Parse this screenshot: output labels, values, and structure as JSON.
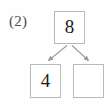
{
  "exercise": {
    "number_label": "(2)"
  },
  "diagram": {
    "type": "number-bond",
    "whole": {
      "value": "8",
      "filled": true
    },
    "parts": [
      {
        "value": "4",
        "filled": true,
        "position": "left"
      },
      {
        "value": "",
        "filled": false,
        "position": "right"
      }
    ],
    "connectors": [
      {
        "from": "whole",
        "to": "part-left",
        "arrowhead": true
      },
      {
        "from": "whole",
        "to": "part-right",
        "arrowhead": true
      }
    ]
  },
  "colors": {
    "background": "#fefefe",
    "box_border": "#b9b9b9",
    "box_fill": "#ffffff",
    "digit": "#1b1b1b",
    "label": "#4a4a4a",
    "arrow": "#9a9a9a"
  }
}
